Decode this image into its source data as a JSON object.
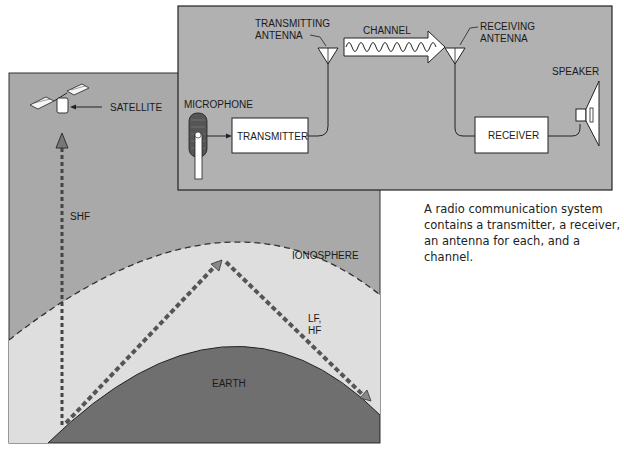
{
  "propagation_panel": {
    "satellite_label": "SATELLITE",
    "shf_label": "SHF",
    "ionosphere_label": "IONOSPHERE",
    "lf_hf_label_line1": "LF,",
    "lf_hf_label_line2": "HF",
    "earth_label": "EARTH"
  },
  "system_panel": {
    "transmitting_antenna_line1": "TRANSMITTING",
    "transmitting_antenna_line2": "ANTENNA",
    "channel_label": "CHANNEL",
    "receiving_antenna_line1": "RECEIVING",
    "receiving_antenna_line2": "ANTENNA",
    "microphone_label": "MICROPHONE",
    "transmitter_label": "TRANSMITTER",
    "receiver_label": "RECEIVER",
    "speaker_label": "SPEAKER"
  },
  "caption": "A radio communication system contains a transmitter, a receiver, an antenna for each, and a channel.",
  "colors": {
    "panel_gray": "#a9a9a9",
    "atmosphere": "#dedede",
    "earth": "#6f6f6f",
    "box_fill": "#ffffff"
  }
}
